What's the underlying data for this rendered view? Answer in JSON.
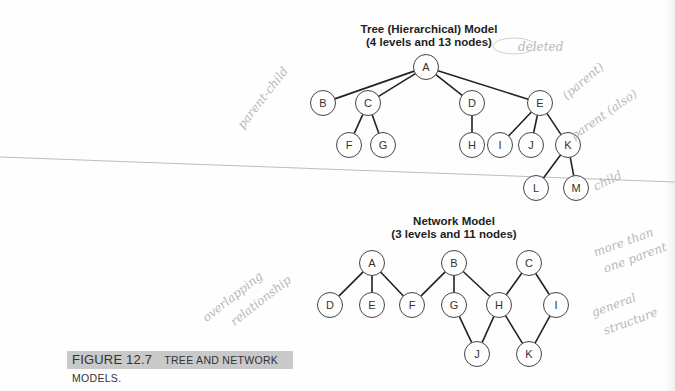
{
  "tree_model": {
    "title_line1": "Tree (Hierarchical) Model",
    "title_line2": "(4 levels and 13 nodes)",
    "levels": 4,
    "node_count": 13,
    "nodes": [
      {
        "id": "A",
        "x": 426,
        "y": 67
      },
      {
        "id": "B",
        "x": 323,
        "y": 103
      },
      {
        "id": "C",
        "x": 368,
        "y": 103
      },
      {
        "id": "D",
        "x": 472,
        "y": 103
      },
      {
        "id": "E",
        "x": 540,
        "y": 103
      },
      {
        "id": "F",
        "x": 349,
        "y": 145
      },
      {
        "id": "G",
        "x": 383,
        "y": 145
      },
      {
        "id": "H",
        "x": 472,
        "y": 145
      },
      {
        "id": "I",
        "x": 500,
        "y": 145
      },
      {
        "id": "J",
        "x": 531,
        "y": 145
      },
      {
        "id": "K",
        "x": 568,
        "y": 145
      },
      {
        "id": "L",
        "x": 536,
        "y": 188
      },
      {
        "id": "M",
        "x": 576,
        "y": 188
      }
    ],
    "edges": [
      [
        "A",
        "B"
      ],
      [
        "A",
        "C"
      ],
      [
        "A",
        "D"
      ],
      [
        "A",
        "E"
      ],
      [
        "C",
        "F"
      ],
      [
        "C",
        "G"
      ],
      [
        "D",
        "H"
      ],
      [
        "E",
        "I"
      ],
      [
        "E",
        "J"
      ],
      [
        "E",
        "K"
      ],
      [
        "K",
        "L"
      ],
      [
        "K",
        "M"
      ]
    ]
  },
  "network_model": {
    "title_line1": "Network Model",
    "title_line2": "(3 levels and 11 nodes)",
    "levels": 3,
    "node_count": 11,
    "nodes": [
      {
        "id": "A",
        "x": 372,
        "y": 263
      },
      {
        "id": "B",
        "x": 454,
        "y": 263
      },
      {
        "id": "C",
        "x": 529,
        "y": 263
      },
      {
        "id": "D",
        "x": 330,
        "y": 305
      },
      {
        "id": "E",
        "x": 372,
        "y": 305
      },
      {
        "id": "F",
        "x": 412,
        "y": 305
      },
      {
        "id": "G",
        "x": 454,
        "y": 305
      },
      {
        "id": "H",
        "x": 499,
        "y": 305
      },
      {
        "id": "I",
        "x": 556,
        "y": 305
      },
      {
        "id": "J",
        "x": 477,
        "y": 354
      },
      {
        "id": "K",
        "x": 529,
        "y": 354
      }
    ],
    "edges": [
      [
        "A",
        "D"
      ],
      [
        "A",
        "E"
      ],
      [
        "A",
        "F"
      ],
      [
        "B",
        "F"
      ],
      [
        "B",
        "G"
      ],
      [
        "B",
        "H"
      ],
      [
        "C",
        "H"
      ],
      [
        "C",
        "I"
      ],
      [
        "G",
        "J"
      ],
      [
        "H",
        "J"
      ],
      [
        "H",
        "K"
      ],
      [
        "I",
        "K"
      ]
    ]
  },
  "caption": {
    "figure_number": "FIGURE 12.7",
    "text": "Tree and Network Models."
  },
  "handwritten_notes": {
    "parent_child": "parent-child",
    "deleted": "deleted",
    "parent": "(parent)",
    "parent_also": "parent (also)",
    "child": "child",
    "more_than_one_parent_1": "more than",
    "more_than_one_parent_2": "one parent",
    "general_structure_1": "general",
    "general_structure_2": "structure",
    "overlapping_1": "overlapping",
    "overlapping_2": "relationship"
  },
  "colors": {
    "node_stroke": "#444444",
    "edge": "#222222",
    "caption_bg": "#c9c9c9",
    "pencil": "#b8b8b8"
  }
}
